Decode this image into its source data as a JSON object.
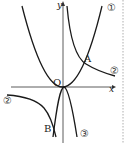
{
  "diagram": {
    "axes": {
      "x_label": "x",
      "y_label": "y",
      "origin_label": "O"
    },
    "points": [
      {
        "id": "A",
        "label": "A"
      },
      {
        "id": "B",
        "label": "B"
      }
    ],
    "curves": [
      {
        "id": "1",
        "label": "①",
        "type": "parabola-up"
      },
      {
        "id": "2",
        "label": "②",
        "type": "hyperbola"
      },
      {
        "id": "3",
        "label": "③",
        "type": "parabola-down"
      }
    ],
    "labels": {
      "curve1": "①",
      "curve2_right": "②",
      "curve2_left": "②",
      "curve3": "③"
    }
  }
}
